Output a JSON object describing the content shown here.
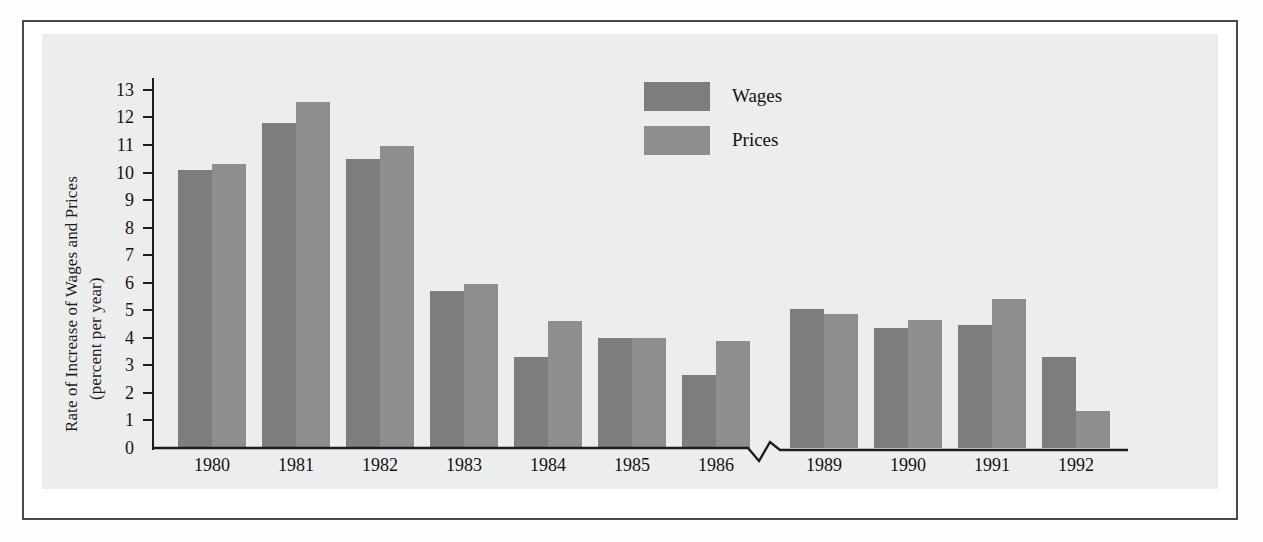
{
  "figure": {
    "background_color": "#eceded",
    "frame_color": "#4a4a4a"
  },
  "legend": {
    "position": "top-center-right",
    "entries": [
      {
        "label": "Wages",
        "color": "#7d7d7d",
        "swatch_name": "legend-swatch-wages"
      },
      {
        "label": "Prices",
        "color": "#8e8e8e",
        "swatch_name": "legend-swatch-prices"
      }
    ]
  },
  "axis": {
    "y_title_line1": "Rate of Increase of Wages and Prices",
    "y_title_line2": "(percent per year)",
    "y_ticks": [
      "0",
      "1",
      "2",
      "3",
      "4",
      "5",
      "6",
      "7",
      "8",
      "9",
      "10",
      "11",
      "12",
      "13"
    ],
    "x_break_note": "axis break between 1986 and 1989"
  },
  "chart_data": {
    "type": "bar",
    "title": "",
    "xlabel": "",
    "ylabel": "Rate of Increase of Wages and Prices (percent per year)",
    "ylim": [
      0,
      13.6
    ],
    "grid": false,
    "legend_position": "top-center-right",
    "axis_break": {
      "between": [
        "1986",
        "1989"
      ],
      "style": "zigzag"
    },
    "categories": [
      "1980",
      "1981",
      "1982",
      "1983",
      "1984",
      "1985",
      "1986",
      "1989",
      "1990",
      "1991",
      "1992"
    ],
    "series": [
      {
        "name": "Wages",
        "color": "#7d7d7d",
        "values": [
          10.1,
          11.8,
          10.5,
          5.7,
          3.3,
          4.0,
          2.65,
          5.05,
          4.35,
          4.45,
          3.3
        ]
      },
      {
        "name": "Prices",
        "color": "#8e8e8e",
        "values": [
          10.3,
          12.55,
          10.95,
          5.95,
          4.6,
          4.0,
          3.9,
          4.85,
          4.65,
          5.4,
          1.35
        ]
      }
    ]
  }
}
